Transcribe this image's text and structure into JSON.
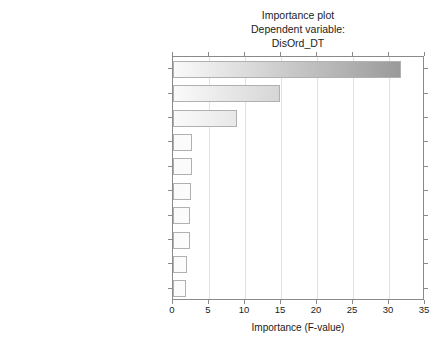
{
  "chart_data": {
    "type": "bar",
    "orientation": "horizontal",
    "title": "Importance plot",
    "subtitle": "Dependent variable:",
    "subtitle2": "DisOrd_DT",
    "xlabel": "Importance (F-value)",
    "ylabel": "",
    "xlim": [
      0,
      35
    ],
    "xticks": [
      0,
      5,
      10,
      15,
      20,
      25,
      30,
      35
    ],
    "xtick_labels": [
      "0",
      "5",
      "10",
      "15",
      "20",
      "25",
      "30",
      "35"
    ],
    "grid": true,
    "legend": false,
    "categories": [
      "Transfer to event time",
      "Bed is clean time",
      "Hosp_stay_(in hours)",
      "Discharge process time (in minutes)",
      "Gap process (in minutes)",
      "Discharge to clean start (in minutes)",
      "Disch_DT",
      "Discharge order time",
      "Discharge to bed is clean (in minutes)",
      "Next admit time"
    ],
    "values": [
      31.7,
      14.9,
      8.9,
      2.6,
      2.6,
      2.5,
      2.4,
      2.3,
      1.9,
      1.8
    ],
    "bar_colors": [
      "#9a9a9a",
      "#d6d6d6",
      "#e8e8e8",
      "#fbfbfb",
      "#fbfbfb",
      "#fcfcfc",
      "#fcfcfc",
      "#fdfdfd",
      "#fdfdfd",
      "#fdfdfd"
    ],
    "bar_gradient_start": "#fafafa",
    "bar_edge_color": "#b0b0b0",
    "axis_color": "#8a8a8a",
    "grid_color": "#e2e2e2",
    "background_color": "#ffffff"
  }
}
